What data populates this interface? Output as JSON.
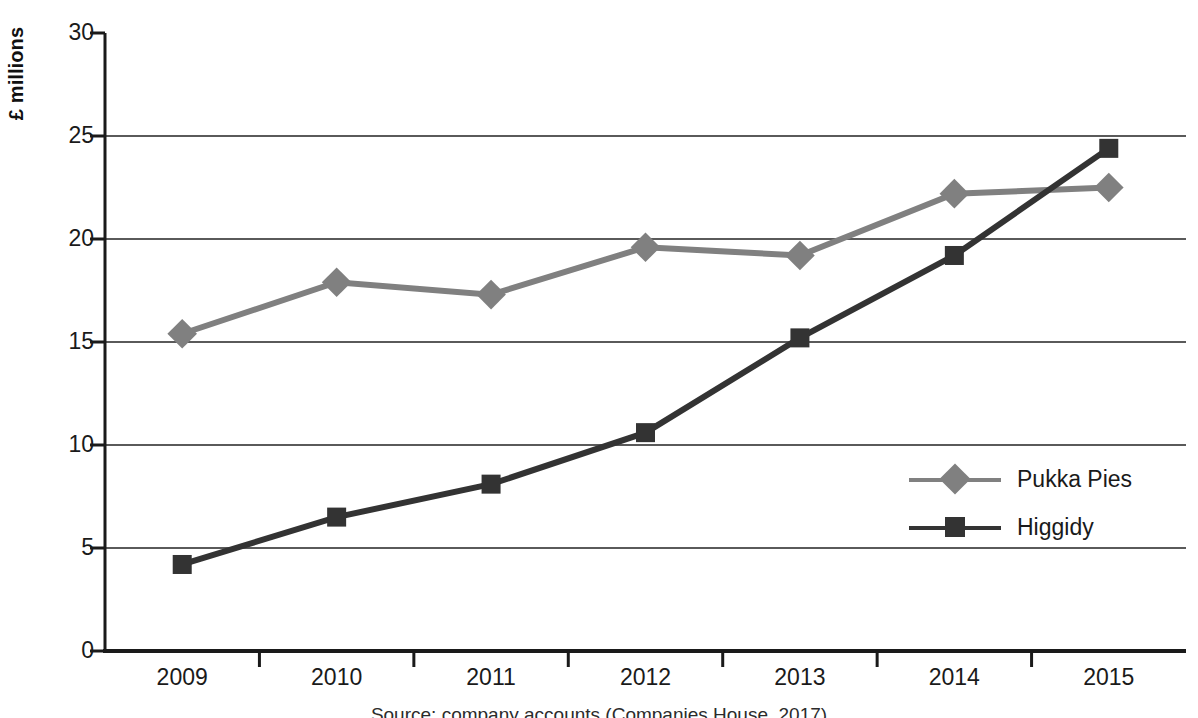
{
  "chart_data": {
    "type": "line",
    "title": "",
    "xlabel": "",
    "ylabel": "£ millions",
    "categories": [
      "2009",
      "2010",
      "2011",
      "2012",
      "2013",
      "2014",
      "2015"
    ],
    "ylim": [
      0,
      30
    ],
    "y_ticks": [
      0,
      5,
      10,
      15,
      20,
      25,
      30
    ],
    "grid": "horizontal",
    "legend_position": "center-right",
    "series": [
      {
        "name": "Pukka Pies",
        "color": "#808080",
        "marker": "diamond",
        "values": [
          15.4,
          17.9,
          17.3,
          19.6,
          19.2,
          22.2,
          22.5
        ]
      },
      {
        "name": "Higgidy",
        "color": "#333333",
        "marker": "square",
        "values": [
          4.2,
          6.5,
          8.1,
          10.6,
          15.2,
          19.2,
          24.4
        ]
      }
    ],
    "annotations": {
      "source_note": "Source: company accounts (Companies House, 2017)"
    }
  },
  "axes": {
    "y_axis_label": "£ millions",
    "y_tick_labels": [
      "30",
      "25",
      "20",
      "15",
      "10",
      "5",
      "0"
    ],
    "x_tick_labels": [
      "2009",
      "2010",
      "2011",
      "2012",
      "2013",
      "2014",
      "2015"
    ]
  },
  "legend": {
    "entries": [
      {
        "label": "Pukka Pies",
        "color": "#808080",
        "marker": "diamond"
      },
      {
        "label": "Higgidy",
        "color": "#333333",
        "marker": "square"
      }
    ]
  },
  "colors": {
    "pukka": "#808080",
    "higgidy": "#333333",
    "axis": "#1a1a1a",
    "grid": "#5a5a5a",
    "background": "#ffffff"
  }
}
